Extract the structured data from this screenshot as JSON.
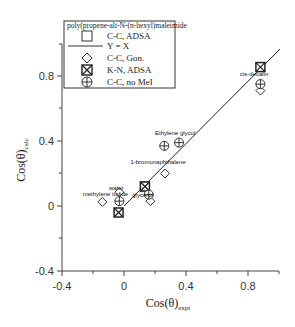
{
  "chart_data": {
    "type": "scatter",
    "title": "",
    "xlabel": "Cos(θ)",
    "xlabel_sub": "expt",
    "ylabel": "Cos(θ)",
    "ylabel_sub": "calc",
    "xlim": [
      -0.4,
      1.0
    ],
    "ylim": [
      -0.4,
      1.0
    ],
    "xticks": [
      -0.4,
      0,
      0.4,
      0.8
    ],
    "yticks": [
      -0.4,
      0,
      0.4,
      0.8
    ],
    "xtick_labels": [
      "-0.4",
      "0",
      "0.4",
      "0.8"
    ],
    "ytick_labels": [
      "-0.4",
      "0",
      "0.4",
      "0.8"
    ],
    "grid": false,
    "legend_position": "upper-left",
    "legend_title": "poly(propene-alt-N-(n-hexyl)maleimide",
    "legend": [
      "C-C,  ADSA",
      "Y = X",
      "C-C,  Gon.",
      "K-N, ADSA",
      "C-C, no MeI"
    ],
    "series": [
      {
        "name": "C-C,  ADSA",
        "marker": "square",
        "points": [
          {
            "x": 0.135,
            "y": 0.12
          }
        ]
      },
      {
        "name": "Y = X",
        "marker": "line",
        "points": [
          {
            "x": 0.0,
            "y": 0.0
          },
          {
            "x": 0.97,
            "y": 0.97
          }
        ]
      },
      {
        "name": "C-C,  Gon.",
        "marker": "diamond",
        "points": [
          {
            "x": -0.14,
            "y": 0.025
          },
          {
            "x": -0.03,
            "y": 0.085
          },
          {
            "x": 0.17,
            "y": 0.03
          },
          {
            "x": 0.265,
            "y": 0.2
          },
          {
            "x": 0.88,
            "y": 0.71
          }
        ]
      },
      {
        "name": "K-N, ADSA",
        "marker": "boxed-x",
        "points": [
          {
            "x": -0.035,
            "y": -0.04
          },
          {
            "x": 0.135,
            "y": 0.12
          },
          {
            "x": 0.88,
            "y": 0.855
          }
        ]
      },
      {
        "name": "C-C, no MeI",
        "marker": "crossed-circle",
        "points": [
          {
            "x": -0.03,
            "y": 0.03
          },
          {
            "x": 0.16,
            "y": 0.07
          },
          {
            "x": 0.26,
            "y": 0.37
          },
          {
            "x": 0.355,
            "y": 0.39
          },
          {
            "x": 0.88,
            "y": 0.75
          }
        ]
      }
    ],
    "annotations": [
      {
        "text": "water",
        "x": -0.05,
        "y": 0.1
      },
      {
        "text": "methylene iodide",
        "x": -0.12,
        "y": 0.06
      },
      {
        "text": "glycerol",
        "x": 0.12,
        "y": 0.055
      },
      {
        "text": "1-bromonaphthalene",
        "x": 0.22,
        "y": 0.26
      },
      {
        "text": "Ethylene glycol",
        "x": 0.33,
        "y": 0.44
      },
      {
        "text": "cis-decalin",
        "x": 0.84,
        "y": 0.8
      }
    ]
  }
}
